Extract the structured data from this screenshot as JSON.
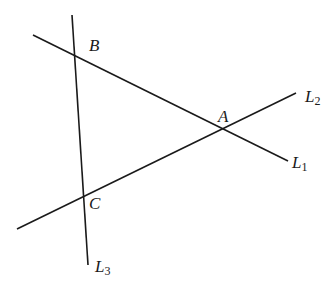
{
  "diagram": {
    "stroke_color": "#1a1a1a",
    "lines": [
      {
        "name": "L1",
        "x1": 33,
        "y1": 35,
        "x2": 288,
        "y2": 161
      },
      {
        "name": "L2",
        "x1": 17,
        "y1": 229,
        "x2": 296,
        "y2": 93
      },
      {
        "name": "L3",
        "x1": 72,
        "y1": 15,
        "x2": 88,
        "y2": 265
      }
    ],
    "points": [
      {
        "name": "B",
        "label": "B",
        "x": 89,
        "y": 37
      },
      {
        "name": "A",
        "label": "A",
        "x": 218,
        "y": 108
      },
      {
        "name": "C",
        "label": "C",
        "x": 89,
        "y": 195
      }
    ],
    "line_labels": [
      {
        "name": "L2",
        "base": "L",
        "sub": "2",
        "x": 305,
        "y": 88
      },
      {
        "name": "L1",
        "base": "L",
        "sub": "1",
        "x": 292,
        "y": 154
      },
      {
        "name": "L3",
        "base": "L",
        "sub": "3",
        "x": 95,
        "y": 258
      }
    ]
  }
}
